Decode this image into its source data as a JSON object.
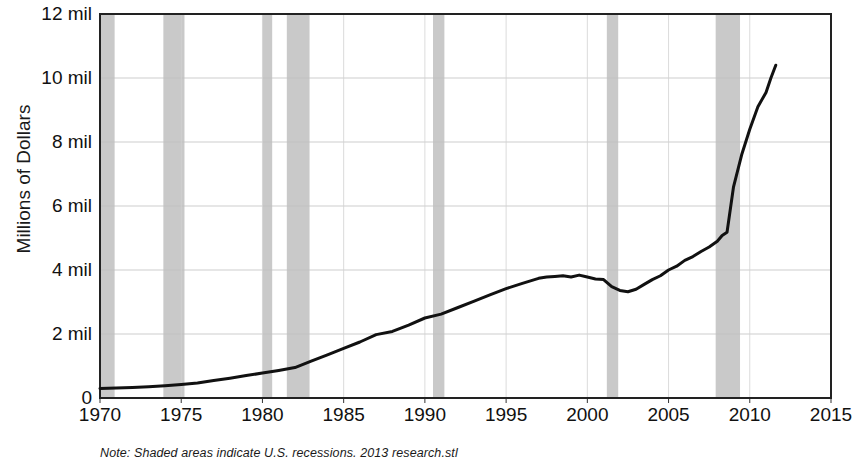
{
  "chart_data": {
    "type": "line",
    "title": "",
    "xlabel": "",
    "ylabel": "Millions of Dollars",
    "xlim": [
      1970,
      2015
    ],
    "ylim": [
      0,
      12
    ],
    "grid": true,
    "legend": false,
    "y_unit": "mil",
    "y_ticks": [
      0,
      2,
      4,
      6,
      8,
      10,
      12
    ],
    "y_tick_labels": [
      "0",
      "2 mil",
      "4 mil",
      "6 mil",
      "8 mil",
      "10 mil",
      "12 mil"
    ],
    "x_ticks": [
      1970,
      1975,
      1980,
      1985,
      1990,
      1995,
      2000,
      2005,
      2010,
      2015
    ],
    "x_tick_labels": [
      "1970",
      "1975",
      "1980",
      "1985",
      "1990",
      "1995",
      "2000",
      "2005",
      "2010",
      "2015"
    ],
    "note": "Note: Shaded areas indicate U.S. recessions. 2013 research.stl",
    "line_color": "#111111",
    "shade_color": "#c9c9c9",
    "recessions": [
      {
        "start": 1969.9,
        "end": 1970.9
      },
      {
        "start": 1973.9,
        "end": 1975.2
      },
      {
        "start": 1980.0,
        "end": 1980.6
      },
      {
        "start": 1981.5,
        "end": 1982.9
      },
      {
        "start": 1990.5,
        "end": 1991.2
      },
      {
        "start": 2001.2,
        "end": 2001.9
      },
      {
        "start": 2007.9,
        "end": 2009.4
      }
    ],
    "series": [
      {
        "name": "Value",
        "x": [
          1970.0,
          1971.0,
          1972.0,
          1973.0,
          1974.0,
          1975.0,
          1976.0,
          1977.0,
          1978.0,
          1979.0,
          1980.0,
          1981.0,
          1982.0,
          1983.0,
          1984.0,
          1985.0,
          1986.0,
          1987.0,
          1988.0,
          1989.0,
          1990.0,
          1991.0,
          1992.0,
          1993.0,
          1994.0,
          1995.0,
          1996.0,
          1996.5,
          1997.0,
          1997.5,
          1998.0,
          1998.5,
          1999.0,
          1999.5,
          2000.0,
          2000.5,
          2001.0,
          2001.5,
          2002.0,
          2002.5,
          2003.0,
          2003.5,
          2004.0,
          2004.5,
          2005.0,
          2005.5,
          2006.0,
          2006.5,
          2007.0,
          2007.5,
          2008.0,
          2008.3,
          2008.6,
          2009.0,
          2009.5,
          2010.0,
          2010.5,
          2011.0,
          2011.3,
          2011.6
        ],
        "values": [
          0.3,
          0.31,
          0.33,
          0.35,
          0.38,
          0.42,
          0.47,
          0.55,
          0.62,
          0.7,
          0.78,
          0.86,
          0.95,
          1.15,
          1.35,
          1.55,
          1.75,
          1.98,
          2.08,
          2.28,
          2.5,
          2.62,
          2.82,
          3.02,
          3.22,
          3.42,
          3.58,
          3.66,
          3.74,
          3.78,
          3.8,
          3.82,
          3.78,
          3.84,
          3.78,
          3.72,
          3.7,
          3.48,
          3.36,
          3.32,
          3.4,
          3.55,
          3.7,
          3.82,
          4.0,
          4.12,
          4.3,
          4.42,
          4.58,
          4.72,
          4.9,
          5.08,
          5.18,
          6.6,
          7.6,
          8.4,
          9.1,
          9.55,
          10.0,
          10.4
        ]
      }
    ]
  }
}
